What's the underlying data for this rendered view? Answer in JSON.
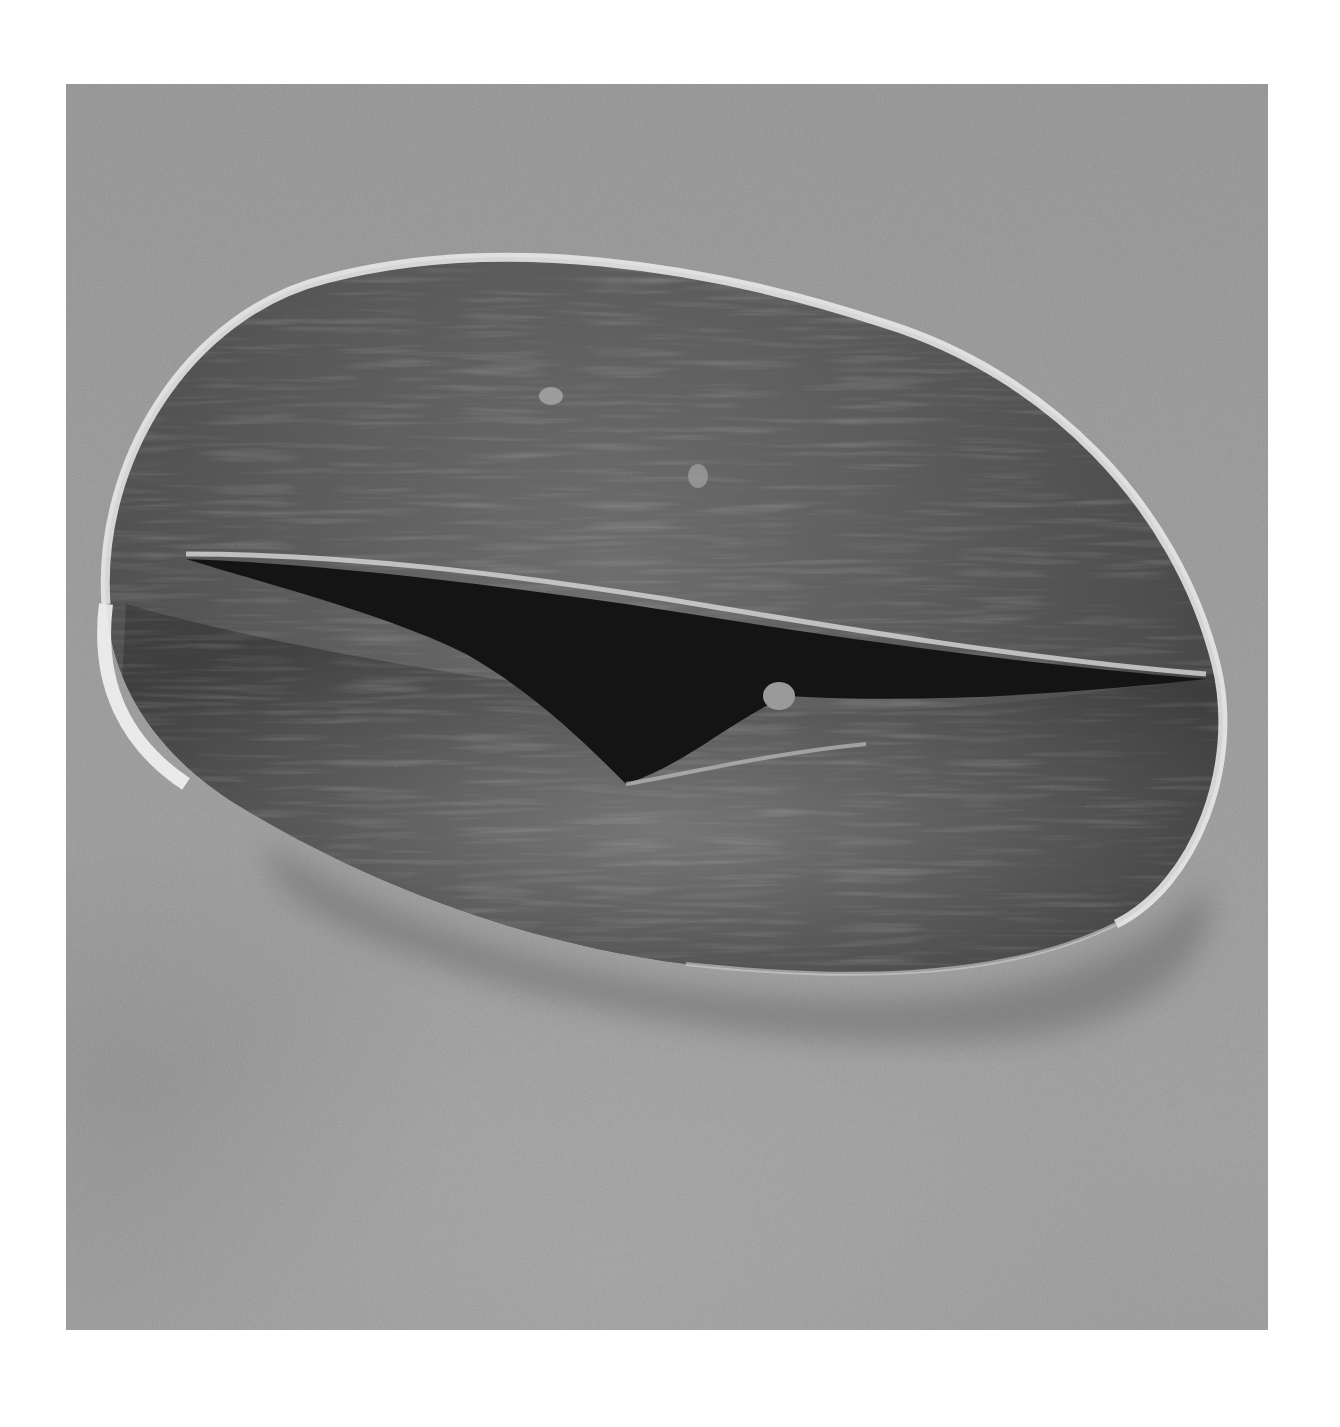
{
  "image": {
    "subject": "SEM micrograph of a pollen grain with a longitudinal furrow (colpus)",
    "colors": {
      "page_background": "#ffffff",
      "substrate": "#9a9a9a",
      "grain_body": "#5a5a5a",
      "grain_rim_highlight": "#f0f0f0",
      "furrow": "#151515",
      "shadow": "#6a6a6a"
    }
  }
}
